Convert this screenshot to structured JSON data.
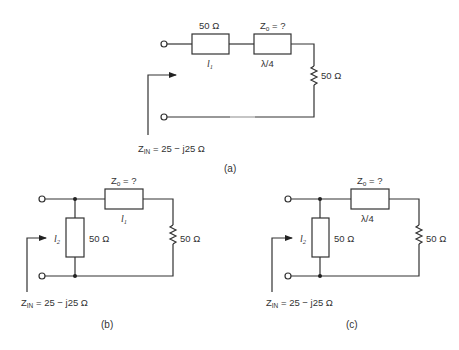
{
  "diagram": {
    "a": {
      "series_line_1": {
        "impedance": "50 Ω",
        "length_main": "l",
        "length_sub": "1"
      },
      "series_line_2": {
        "impedance_main": "Z",
        "impedance_sub": "o",
        "impedance_rest": " = ?",
        "length": "λ/4"
      },
      "load": {
        "label": "50 Ω"
      },
      "zin": {
        "main": "Z",
        "sub": "IN",
        "value": " = 25 − j25 Ω"
      },
      "caption": "(a)"
    },
    "b": {
      "series_line": {
        "impedance_main": "Z",
        "impedance_sub": "o",
        "impedance_rest": " = ?",
        "length_main": "l",
        "length_sub": "1"
      },
      "shunt_stub": {
        "impedance": "50 Ω",
        "length_main": "l",
        "length_sub": "2"
      },
      "load": {
        "label": "50 Ω"
      },
      "zin": {
        "main": "Z",
        "sub": "IN",
        "value": " = 25 − j25 Ω"
      },
      "caption": "(b)"
    },
    "c": {
      "series_line": {
        "impedance_main": "Z",
        "impedance_sub": "o",
        "impedance_rest": " = ?",
        "length": "λ/4"
      },
      "shunt_stub": {
        "impedance": "50 Ω",
        "length_main": "l",
        "length_sub": "2"
      },
      "load": {
        "label": "50 Ω"
      },
      "zin": {
        "main": "Z",
        "sub": "IN",
        "value": " = 25 − j25 Ω"
      },
      "caption": "(c)"
    }
  }
}
